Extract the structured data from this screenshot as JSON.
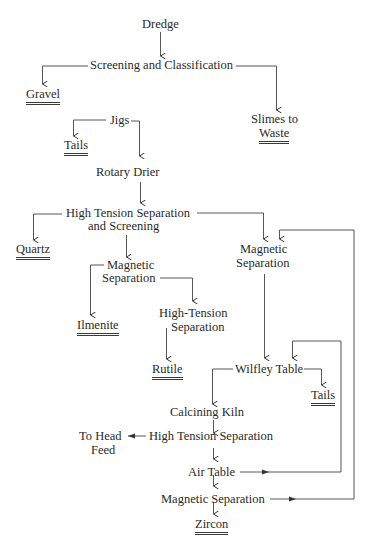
{
  "diagram": {
    "type": "process-flowsheet",
    "nodes": {
      "dredge": "Dredge",
      "screening": "Screening and Classification",
      "gravel": "Gravel",
      "slimes_1": "Slimes to",
      "slimes_2": "Waste",
      "jigs": "Jigs",
      "tails_1": "Tails",
      "rotary_drier": "Rotary Drier",
      "hts_1": "High Tension Separation",
      "hts_2": "and Screening",
      "quartz": "Quartz",
      "mag_sep_a_1": "Magnetic",
      "mag_sep_a_2": "Separation",
      "mag_sep_b_1": "Magnetic",
      "mag_sep_b_2": "Separation",
      "ilmenite": "Ilmenite",
      "hts_b_1": "High-Tension",
      "hts_b_2": "Separation",
      "rutile": "Rutile",
      "wilfley": "Wilfley Table",
      "tails_2": "Tails",
      "calcining": "Calcining Kiln",
      "to_head_1": "To Head",
      "to_head_2": "Feed",
      "hts_c": "High Tension Separation",
      "air_table": "Air Table",
      "mag_sep_c": "Magnetic Separation",
      "zircon": "Zircon"
    },
    "edges": [
      [
        "Dredge",
        "Screening and Classification"
      ],
      [
        "Screening and Classification",
        "Gravel"
      ],
      [
        "Screening and Classification",
        "Slimes to Waste"
      ],
      [
        "Jigs",
        "Tails"
      ],
      [
        "Jigs",
        "Rotary Drier"
      ],
      [
        "Rotary Drier",
        "High Tension Separation and Screening"
      ],
      [
        "High Tension Separation and Screening",
        "Quartz"
      ],
      [
        "High Tension Separation and Screening",
        "Magnetic Separation (left)"
      ],
      [
        "High Tension Separation and Screening",
        "Magnetic Separation (right)"
      ],
      [
        "Magnetic Separation (left)",
        "Ilmenite"
      ],
      [
        "Magnetic Separation (left)",
        "High-Tension Separation"
      ],
      [
        "High-Tension Separation",
        "Rutile"
      ],
      [
        "Magnetic Separation (right)",
        "Wilfley Table"
      ],
      [
        "Wilfley Table",
        "Tails"
      ],
      [
        "Wilfley Table",
        "Calcining Kiln"
      ],
      [
        "Calcining Kiln",
        "High Tension Separation"
      ],
      [
        "High Tension Separation",
        "To Head Feed"
      ],
      [
        "High Tension Separation",
        "Air Table"
      ],
      [
        "Air Table",
        "Wilfley Table"
      ],
      [
        "Air Table",
        "Magnetic Separation"
      ],
      [
        "Magnetic Separation",
        "Magnetic Separation (right)"
      ],
      [
        "Magnetic Separation",
        "Zircon"
      ]
    ]
  }
}
